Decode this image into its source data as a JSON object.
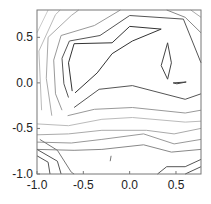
{
  "chart_data": {
    "type": "contour",
    "title": "",
    "xlabel": "",
    "ylabel": "",
    "xlim": [
      -1.0,
      0.77
    ],
    "ylim": [
      -1.0,
      0.8
    ],
    "grid": false,
    "legend": null,
    "x_ticks": [
      {
        "value": -1.0,
        "label": "-1.0"
      },
      {
        "value": -0.5,
        "label": "-0.5"
      },
      {
        "value": 0.0,
        "label": "0.0"
      },
      {
        "value": 0.5,
        "label": "0.5"
      }
    ],
    "y_ticks": [
      {
        "value": -1.0,
        "label": "-1.0"
      },
      {
        "value": -0.5,
        "label": "-0.5"
      },
      {
        "value": 0.0,
        "label": "0.0"
      },
      {
        "value": 0.5,
        "label": "0.5"
      }
    ],
    "contours": [
      {
        "color": "#333333",
        "points": [
          [
            -0.62,
            -0.09
          ],
          [
            -0.66,
            0.22
          ],
          [
            -0.6,
            0.43
          ],
          [
            -0.19,
            0.44
          ],
          [
            0.0,
            0.62
          ],
          [
            0.34,
            0.59
          ],
          [
            0.03,
            0.46
          ],
          [
            -0.19,
            0.32
          ],
          [
            -0.35,
            0.11
          ],
          [
            -0.59,
            -0.11
          ]
        ]
      },
      {
        "color": "#444444",
        "points": [
          [
            0.41,
            0.44
          ],
          [
            0.45,
            0.22
          ],
          [
            0.41,
            0.04
          ],
          [
            0.34,
            0.19
          ],
          [
            0.41,
            0.44
          ]
        ]
      },
      {
        "color": "#444444",
        "points": [
          [
            0.47,
            0.0
          ],
          [
            0.61,
            0.01
          ],
          [
            0.51,
            -0.01
          ],
          [
            0.47,
            0.0
          ]
        ]
      },
      {
        "color": "#555555",
        "points": [
          [
            -0.66,
            -0.16
          ],
          [
            -0.71,
            -0.01
          ],
          [
            -0.73,
            0.27
          ],
          [
            -0.65,
            0.46
          ],
          [
            -0.32,
            0.52
          ],
          [
            0.0,
            0.74
          ],
          [
            0.58,
            0.7
          ],
          [
            0.77,
            0.22
          ]
        ]
      },
      {
        "color": "#555555",
        "points": [
          [
            -0.6,
            -0.27
          ],
          [
            -0.33,
            -0.07
          ],
          [
            0.03,
            -0.03
          ],
          [
            0.6,
            -0.18
          ],
          [
            0.77,
            -0.12
          ]
        ]
      },
      {
        "color": "#999999",
        "points": [
          [
            -0.73,
            -0.3
          ],
          [
            -0.8,
            -0.12
          ],
          [
            -0.82,
            0.25
          ],
          [
            -0.74,
            0.52
          ],
          [
            -0.38,
            0.63
          ],
          [
            -0.1,
            0.8
          ]
        ]
      },
      {
        "color": "#aaaaaa",
        "points": [
          [
            -0.84,
            -0.36
          ],
          [
            -0.9,
            0.05
          ],
          [
            -0.88,
            0.5
          ],
          [
            -0.63,
            0.74
          ],
          [
            -0.55,
            0.8
          ]
        ]
      },
      {
        "color": "#bbbbbb",
        "points": [
          [
            -0.95,
            -0.3
          ],
          [
            -0.98,
            0.35
          ],
          [
            -0.8,
            0.75
          ],
          [
            -0.75,
            0.8
          ]
        ]
      },
      {
        "color": "#cccccc",
        "points": [
          [
            -1.0,
            0.55
          ],
          [
            -0.88,
            0.8
          ]
        ]
      },
      {
        "color": "#888888",
        "points": [
          [
            0.4,
            0.8
          ],
          [
            0.6,
            0.72
          ],
          [
            0.77,
            0.55
          ]
        ]
      },
      {
        "color": "#aaaaaa",
        "points": [
          [
            0.66,
            0.8
          ],
          [
            0.77,
            0.72
          ]
        ]
      },
      {
        "color": "#999999",
        "points": [
          [
            -0.67,
            -0.36
          ],
          [
            -0.38,
            -0.29
          ],
          [
            0.03,
            -0.27
          ],
          [
            0.6,
            -0.33
          ],
          [
            0.77,
            -0.3
          ]
        ]
      },
      {
        "color": "#bbbbbb",
        "points": [
          [
            -1.0,
            -0.45
          ],
          [
            -0.66,
            -0.47
          ],
          [
            -0.3,
            -0.4
          ],
          [
            0.03,
            -0.38
          ],
          [
            0.6,
            -0.43
          ],
          [
            0.77,
            -0.42
          ]
        ]
      },
      {
        "color": "#aaaaaa",
        "points": [
          [
            -1.0,
            -0.57
          ],
          [
            -0.66,
            -0.56
          ],
          [
            -0.3,
            -0.52
          ],
          [
            0.18,
            -0.52
          ],
          [
            0.48,
            -0.56
          ],
          [
            0.77,
            -0.5
          ]
        ]
      },
      {
        "color": "#999999",
        "points": [
          [
            -1.0,
            -0.65
          ],
          [
            -0.63,
            -0.66
          ],
          [
            -0.3,
            -0.62
          ],
          [
            0.15,
            -0.56
          ],
          [
            0.48,
            -0.67
          ],
          [
            0.77,
            -0.62
          ]
        ]
      },
      {
        "color": "#888888",
        "points": [
          [
            -1.0,
            -0.73
          ],
          [
            -0.6,
            -0.74
          ],
          [
            -0.3,
            -0.73
          ],
          [
            0.15,
            -0.68
          ],
          [
            0.45,
            -0.76
          ],
          [
            0.77,
            -0.73
          ]
        ]
      },
      {
        "color": "#555555",
        "points": [
          [
            -1.0,
            -0.8
          ],
          [
            -0.88,
            -0.87
          ],
          [
            -0.86,
            -1.0
          ]
        ]
      },
      {
        "color": "#555555",
        "points": [
          [
            -1.0,
            -0.73
          ],
          [
            -0.78,
            -0.86
          ],
          [
            -0.74,
            -1.0
          ]
        ]
      },
      {
        "color": "#777777",
        "points": [
          [
            -0.97,
            -0.62
          ],
          [
            -0.78,
            -0.74
          ],
          [
            -0.63,
            -0.98
          ],
          [
            -0.6,
            -1.0
          ]
        ]
      },
      {
        "color": "#777777",
        "points": [
          [
            -0.2,
            -0.8
          ],
          [
            -0.21,
            -0.86
          ]
        ]
      },
      {
        "color": "#555555",
        "points": [
          [
            0.3,
            -1.0
          ],
          [
            0.4,
            -0.92
          ],
          [
            0.6,
            -0.92
          ],
          [
            0.77,
            -0.84
          ]
        ]
      },
      {
        "color": "#555555",
        "points": [
          [
            0.6,
            -1.0
          ],
          [
            0.77,
            -0.92
          ]
        ]
      }
    ]
  },
  "axes": {
    "frame_color": "#777777"
  }
}
